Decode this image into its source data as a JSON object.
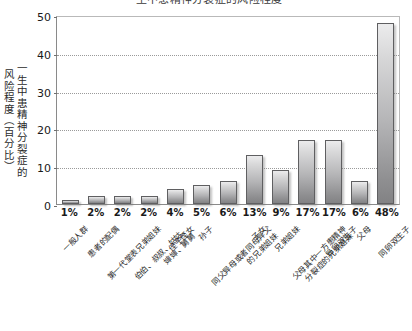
{
  "chart_data": {
    "type": "bar",
    "title": "一生中患精神分裂症的风险程度",
    "xlabel": "",
    "ylabel_line1": "一生中患精神分裂症的",
    "ylabel_line2": "风险程度（百分比）",
    "ylim": [
      0,
      50
    ],
    "yticks": [
      0,
      10,
      20,
      30,
      40,
      50
    ],
    "grid": "horizontal-dotted",
    "legend": "none",
    "bar_color": "#c0c0c2",
    "bar_edge_color": "#5f5f61",
    "categories": [
      "一般人群",
      "患者的配偶",
      "第一代堂表兄弟姐妹",
      "伯伯、叔叔、姑姑、婶婶、舅舅",
      "侄子侄女",
      "孙子",
      "同父异母或者同母异父的兄弟姐妹",
      "子女",
      "兄弟姐妹",
      "父母其中一方患精神分裂症的兄弟姐妹",
      "异卵双生子",
      "父母",
      "同卵双生子"
    ],
    "category_lines": [
      [
        "一般人群",
        ""
      ],
      [
        "患者的配偶",
        ""
      ],
      [
        "第一代堂表兄弟姐妹",
        ""
      ],
      [
        "伯伯、叔叔、姑姑、",
        "婶婶、舅舅"
      ],
      [
        "侄子侄女",
        ""
      ],
      [
        "孙子",
        ""
      ],
      [
        "同父异母或者同母异父",
        "的兄弟姐妹"
      ],
      [
        "子女",
        ""
      ],
      [
        "兄弟姐妹",
        ""
      ],
      [
        "父母其中一方患精神",
        "分裂症的兄弟姐妹"
      ],
      [
        "异卵双生子",
        ""
      ],
      [
        "父母",
        ""
      ],
      [
        "同卵双生子",
        ""
      ]
    ],
    "values": [
      1,
      2,
      2,
      2,
      4,
      5,
      6,
      13,
      9,
      17,
      17,
      6,
      48
    ],
    "value_labels": [
      "1%",
      "2%",
      "2%",
      "2%",
      "4%",
      "5%",
      "6%",
      "13%",
      "9%",
      "17%",
      "17%",
      "6%",
      "48%"
    ]
  }
}
